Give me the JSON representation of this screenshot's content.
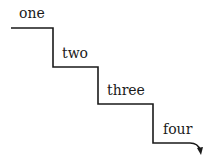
{
  "diagram": {
    "type": "staircase",
    "steps": [
      {
        "label": "one"
      },
      {
        "label": "two"
      },
      {
        "label": "three"
      },
      {
        "label": "four"
      }
    ],
    "line_color": "#1a1a1a",
    "end_marker": "arrow-down"
  }
}
